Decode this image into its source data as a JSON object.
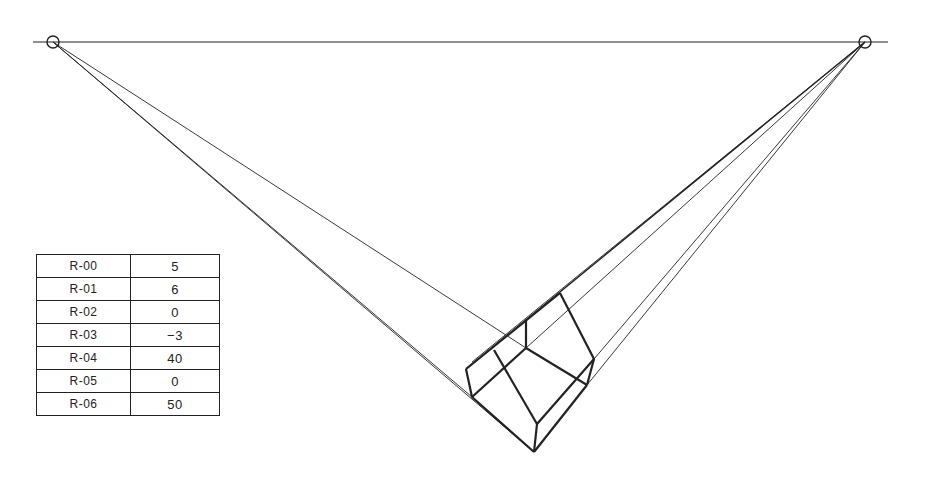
{
  "diagram": {
    "type": "two-point-perspective",
    "horizon_y": 42,
    "vanishing_points": {
      "left": {
        "x": 53,
        "y": 42
      },
      "right": {
        "x": 865,
        "y": 42
      }
    },
    "colors": {
      "line": "#222222",
      "background": "#ffffff"
    }
  },
  "parameters": {
    "rows": [
      {
        "key": "R-00",
        "value": "5"
      },
      {
        "key": "R-01",
        "value": "6"
      },
      {
        "key": "R-02",
        "value": "0"
      },
      {
        "key": "R-03",
        "value": "−3"
      },
      {
        "key": "R-04",
        "value": "40"
      },
      {
        "key": "R-05",
        "value": "0"
      },
      {
        "key": "R-06",
        "value": "50"
      }
    ]
  }
}
